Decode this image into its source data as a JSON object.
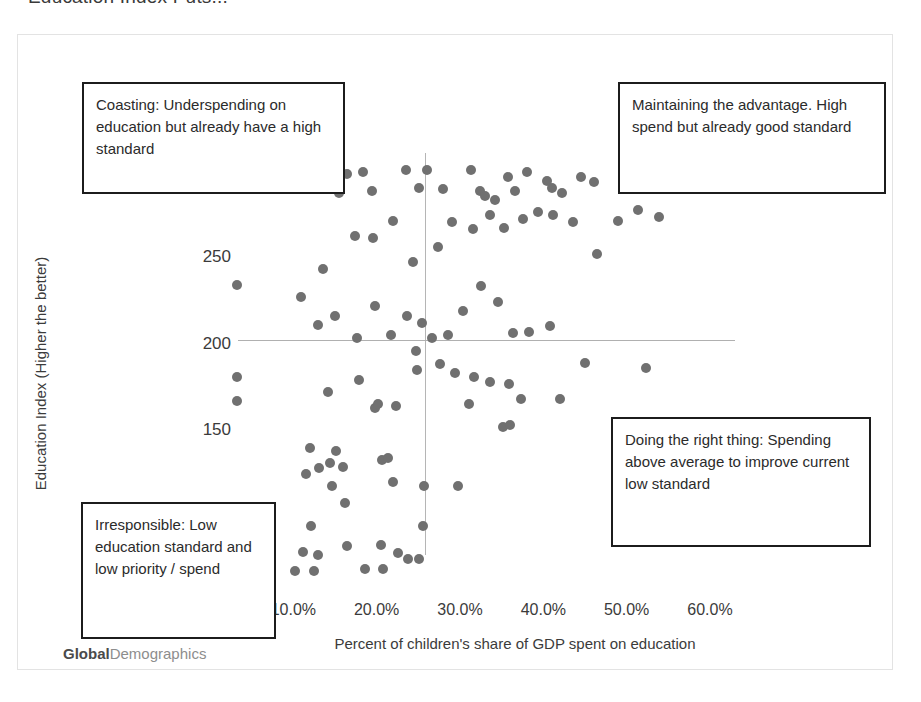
{
  "slide": {
    "title": "Education Index Puts..."
  },
  "watermark": {
    "bold_part": "Global",
    "light_part": "Demographics"
  },
  "callouts": {
    "coasting": "Coasting:  Underspending on education but already have a high standard",
    "maintaining": "Maintaining the advantage. High spend but already good standard",
    "doing_right": "Doing the right thing: Spending above average to improve current low standard",
    "irresponsible": "Irresponsible: Low education standard and low priority / spend"
  },
  "colors": {
    "marker": "#707070",
    "reference_line": "#b0b0b0",
    "callout_border": "#1c1c1c",
    "frame": "#e3e3e3"
  },
  "chart_data": {
    "type": "scatter",
    "title": "Education Index Puts...",
    "xlabel": "Percent of children's share of GDP spent on education",
    "ylabel": "Education Index (Higher the better)",
    "xlim": [
      3.0,
      63.0
    ],
    "ylim": [
      55,
      310
    ],
    "xticks": [
      10.0,
      20.0,
      30.0,
      40.0,
      50.0,
      60.0
    ],
    "xticklabels": [
      "10.0%",
      "20.0%",
      "30.0%",
      "40.0%",
      "50.0%",
      "60.0%"
    ],
    "yticks": [
      100,
      150,
      200,
      250,
      300
    ],
    "yticklabels": [
      "100",
      "150",
      "200",
      "250",
      "300"
    ],
    "grid": false,
    "legend": null,
    "reference_lines": {
      "vertical_x": 25.8,
      "horizontal_y": 202
    },
    "quadrant_labels": {
      "top_left": "Coasting:  Underspending on education but already have a high standard",
      "top_right": "Maintaining the advantage. High spend but already good standard",
      "bottom_right": "Doing the right thing: Spending above average to improve current low standard",
      "bottom_left": "Irresponsible: Low education standard and low priority / spend"
    },
    "points": [
      [
        3.2,
        234
      ],
      [
        3.2,
        181
      ],
      [
        3.2,
        167
      ],
      [
        16.4,
        298
      ],
      [
        18.3,
        299
      ],
      [
        23.5,
        300
      ],
      [
        26.0,
        300
      ],
      [
        15.5,
        287
      ],
      [
        19.4,
        288
      ],
      [
        25.1,
        290
      ],
      [
        27.9,
        289
      ],
      [
        31.3,
        300
      ],
      [
        35.7,
        296
      ],
      [
        38.0,
        299
      ],
      [
        40.4,
        294
      ],
      [
        36.6,
        288
      ],
      [
        41.0,
        290
      ],
      [
        42.2,
        287
      ],
      [
        44.5,
        296
      ],
      [
        46.1,
        293
      ],
      [
        50.4,
        296
      ],
      [
        53.6,
        297
      ],
      [
        54.6,
        290
      ],
      [
        32.4,
        288
      ],
      [
        33.0,
        285
      ],
      [
        34.2,
        283
      ],
      [
        10.9,
        227
      ],
      [
        13.6,
        243
      ],
      [
        17.4,
        262
      ],
      [
        19.5,
        261
      ],
      [
        22.0,
        271
      ],
      [
        24.4,
        247
      ],
      [
        27.4,
        256
      ],
      [
        29.0,
        270
      ],
      [
        31.6,
        266
      ],
      [
        33.6,
        274
      ],
      [
        35.3,
        267
      ],
      [
        37.6,
        272
      ],
      [
        39.4,
        276
      ],
      [
        41.2,
        274
      ],
      [
        43.5,
        270
      ],
      [
        46.4,
        252
      ],
      [
        48.9,
        271
      ],
      [
        51.4,
        277
      ],
      [
        53.9,
        273
      ],
      [
        12.9,
        211
      ],
      [
        15.0,
        216
      ],
      [
        17.6,
        203
      ],
      [
        19.8,
        222
      ],
      [
        21.7,
        205
      ],
      [
        23.6,
        216
      ],
      [
        25.4,
        212
      ],
      [
        26.6,
        203
      ],
      [
        28.5,
        205
      ],
      [
        30.4,
        219
      ],
      [
        32.5,
        233
      ],
      [
        34.6,
        224
      ],
      [
        36.4,
        206
      ],
      [
        38.3,
        207
      ],
      [
        40.8,
        210
      ],
      [
        24.7,
        196
      ],
      [
        24.8,
        185
      ],
      [
        17.9,
        179
      ],
      [
        27.6,
        188
      ],
      [
        29.4,
        183
      ],
      [
        31.7,
        181
      ],
      [
        33.6,
        178
      ],
      [
        35.9,
        177
      ],
      [
        37.3,
        168
      ],
      [
        42.0,
        168
      ],
      [
        45.0,
        189
      ],
      [
        52.3,
        186
      ],
      [
        14.2,
        172
      ],
      [
        19.8,
        163
      ],
      [
        20.1,
        165
      ],
      [
        22.3,
        164
      ],
      [
        31.1,
        165
      ],
      [
        35.2,
        152
      ],
      [
        36.0,
        153
      ],
      [
        12.0,
        140
      ],
      [
        13.1,
        128
      ],
      [
        14.4,
        131
      ],
      [
        15.1,
        138
      ],
      [
        16.0,
        129
      ],
      [
        11.5,
        125
      ],
      [
        20.6,
        133
      ],
      [
        21.4,
        134
      ],
      [
        22.0,
        120
      ],
      [
        14.6,
        118
      ],
      [
        25.7,
        118
      ],
      [
        29.7,
        118
      ],
      [
        16.2,
        108
      ],
      [
        12.1,
        95
      ],
      [
        25.6,
        95
      ],
      [
        11.2,
        80
      ],
      [
        13.0,
        78
      ],
      [
        16.4,
        83
      ],
      [
        20.5,
        84
      ],
      [
        22.5,
        79
      ],
      [
        23.8,
        76
      ],
      [
        25.1,
        76
      ],
      [
        10.2,
        69
      ],
      [
        12.5,
        69
      ],
      [
        18.6,
        70
      ],
      [
        20.8,
        70
      ]
    ]
  }
}
